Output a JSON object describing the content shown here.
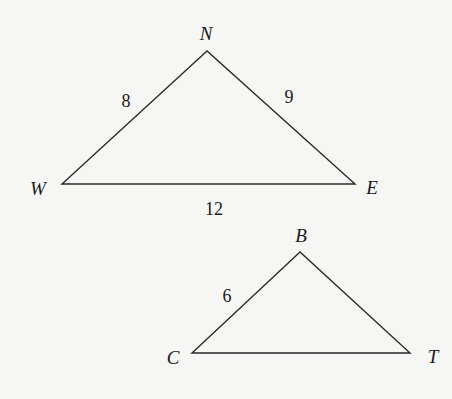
{
  "diagram": {
    "type": "similar-triangles",
    "background": "#f6f6f4",
    "line_color": "#2a2a2a",
    "triangles": [
      {
        "name": "NWE",
        "vertices": [
          {
            "label": "N",
            "x": 207,
            "y": 51,
            "label_x": 206,
            "label_y": 40
          },
          {
            "label": "W",
            "x": 62,
            "y": 184,
            "label_x": 38,
            "label_y": 195
          },
          {
            "label": "E",
            "x": 355,
            "y": 184,
            "label_x": 372,
            "label_y": 194
          }
        ],
        "sides": [
          {
            "between": "W-N",
            "length": "8",
            "label_x": 126,
            "label_y": 107
          },
          {
            "between": "N-E",
            "length": "9",
            "label_x": 289,
            "label_y": 103
          },
          {
            "between": "W-E",
            "length": "12",
            "label_x": 214,
            "label_y": 215
          }
        ]
      },
      {
        "name": "BCT",
        "vertices": [
          {
            "label": "B",
            "x": 300,
            "y": 252,
            "label_x": 301,
            "label_y": 242
          },
          {
            "label": "C",
            "x": 192,
            "y": 353,
            "label_x": 173,
            "label_y": 364
          },
          {
            "label": "T",
            "x": 410,
            "y": 353,
            "label_x": 433,
            "label_y": 363
          }
        ],
        "sides": [
          {
            "between": "C-B",
            "length": "6",
            "label_x": 227,
            "label_y": 302
          }
        ]
      }
    ]
  }
}
